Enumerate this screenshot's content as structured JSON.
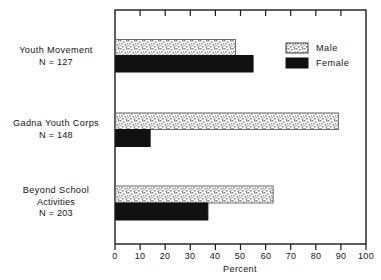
{
  "chart_data": {
    "type": "bar",
    "orientation": "horizontal",
    "title": "",
    "xlabel": "Percent",
    "ylabel": "",
    "xlim": [
      0,
      100
    ],
    "xticks": [
      "0",
      "10",
      "20",
      "30",
      "40",
      "50",
      "60",
      "70",
      "80",
      "90",
      "100"
    ],
    "grid": false,
    "legend_position": "top-right",
    "categories": [
      "Youth Movement",
      "Gadna Youth Corps",
      "Beyond School Activities"
    ],
    "category_lines": [
      [
        "Youth Movement",
        "N = 127"
      ],
      [
        "Gadna Youth Corps",
        "N = 148"
      ],
      [
        "Beyond School",
        "Activities",
        "N = 203"
      ]
    ],
    "sample_sizes": [
      127,
      148,
      203
    ],
    "series": [
      {
        "name": "Male",
        "values": [
          48,
          89,
          63
        ],
        "fill": "stipple",
        "color": "#d9d9d9"
      },
      {
        "name": "Female",
        "values": [
          55,
          14,
          37
        ],
        "fill": "solid",
        "color": "#111111"
      }
    ]
  },
  "legend": {
    "items": [
      {
        "label": "Male",
        "swatch": "stipple-swatch"
      },
      {
        "label": "Female",
        "swatch": "black-swatch"
      }
    ]
  },
  "axis": {
    "x_title": "Percent",
    "ticks": [
      "0",
      "10",
      "20",
      "30",
      "40",
      "50",
      "60",
      "70",
      "80",
      "90",
      "100"
    ]
  },
  "colors": {
    "frame": "#1b1b1b",
    "male_bar": "#dcdcdc",
    "female_bar": "#111111",
    "text": "#151515",
    "background": "#ffffff"
  }
}
